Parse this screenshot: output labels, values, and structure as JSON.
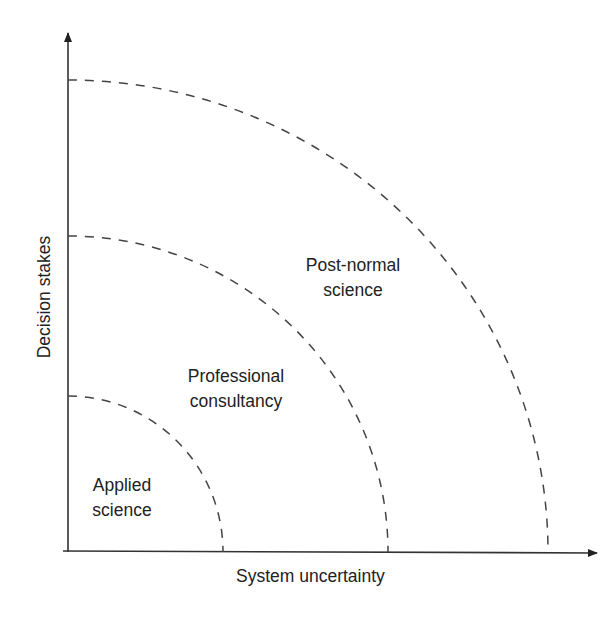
{
  "diagram": {
    "type": "nested quarter-ellipse zones",
    "axes": {
      "x_label": "System uncertainty",
      "y_label": "Decision stakes"
    },
    "zones": [
      {
        "id": "applied",
        "line1": "Applied",
        "line2": "science"
      },
      {
        "id": "professional",
        "line1": "Professional",
        "line2": "consultancy"
      },
      {
        "id": "postnormal",
        "line1": "Post-normal",
        "line2": "science"
      }
    ],
    "colors": {
      "line": "#333333",
      "dash": "#444444",
      "text": "#222222",
      "background": "#ffffff"
    }
  }
}
